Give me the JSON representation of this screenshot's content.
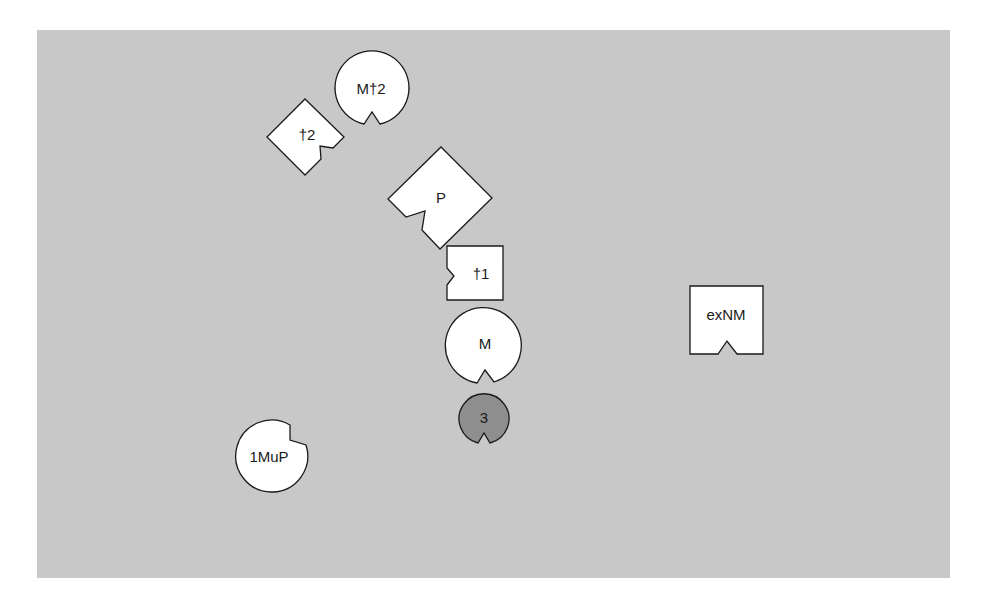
{
  "diagram": {
    "background": "#c8c8c8",
    "shape_fill": "#ffffff",
    "highlight_fill": "#8e8e8e",
    "nodes": [
      {
        "id": "M2",
        "label": "M†2",
        "shape": "notched-circle",
        "notch": "bottom"
      },
      {
        "id": "t2",
        "label": "†2",
        "shape": "notched-diamond",
        "notch": "lower-right"
      },
      {
        "id": "P",
        "label": "P",
        "shape": "notched-diamond",
        "notch": "lower-left"
      },
      {
        "id": "t1",
        "label": "†1",
        "shape": "notched-square",
        "notch": "left"
      },
      {
        "id": "M",
        "label": "M",
        "shape": "notched-circle",
        "notch": "bottom"
      },
      {
        "id": "three",
        "label": "3",
        "shape": "notched-circle",
        "notch": "bottom",
        "highlighted": true
      },
      {
        "id": "MuP",
        "label": "1MuP",
        "shape": "notched-circle",
        "notch": "upper-right"
      },
      {
        "id": "exNM",
        "label": "exNM",
        "shape": "notched-square",
        "notch": "bottom"
      }
    ]
  }
}
